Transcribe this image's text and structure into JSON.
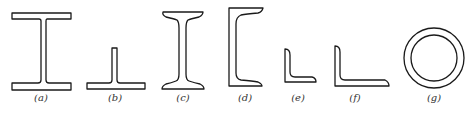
{
  "figure": {
    "line_color": "#1a1a1a",
    "background": "#ffffff",
    "items": [
      {
        "id": "a",
        "label": "(a)",
        "section": "welded I-beam"
      },
      {
        "id": "b",
        "label": "(b)",
        "section": "T-section"
      },
      {
        "id": "c",
        "label": "(c)",
        "section": "rolled I-beam"
      },
      {
        "id": "d",
        "label": "(d)",
        "section": "channel"
      },
      {
        "id": "e",
        "label": "(e)",
        "section": "equal angle"
      },
      {
        "id": "f",
        "label": "(f)",
        "section": "unequal angle"
      },
      {
        "id": "g",
        "label": "(g)",
        "section": "circular hollow tube"
      }
    ]
  }
}
